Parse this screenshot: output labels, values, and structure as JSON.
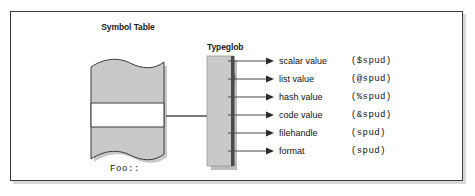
{
  "figure": {
    "symbol_table": {
      "heading": "Symbol Table",
      "entry": "Foo::"
    },
    "typeglob": {
      "heading_line1": "Typeglob",
      "heading_line2": "(*spud)"
    },
    "slots": [
      {
        "label": "scalar value",
        "value": "($spud)"
      },
      {
        "label": "list value",
        "value": "(@spud)"
      },
      {
        "label": "hash value",
        "value": "(%spud)"
      },
      {
        "label": "code value",
        "value": "(&spud)"
      },
      {
        "label": "filehandle",
        "value": "(spud)"
      },
      {
        "label": "format",
        "value": "(spud)"
      }
    ]
  },
  "colors": {
    "paper_fill": "#c9c9c9",
    "glob_fill": "#c9c9c9",
    "frame_border": "#3a3a3a",
    "ink": "#111111",
    "shadow": "#8a8a8a"
  }
}
